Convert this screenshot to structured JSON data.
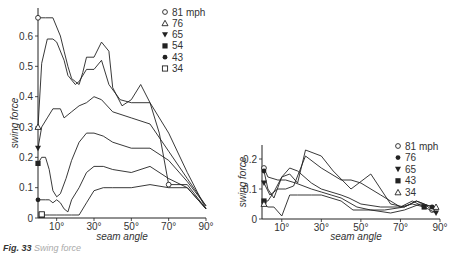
{
  "caption": {
    "label": "Fig. 33",
    "text": "Swing force"
  },
  "chart_data": [
    {
      "type": "line",
      "title": "",
      "xlabel": "seam angle",
      "ylabel": "swing force",
      "xlim": [
        0,
        90
      ],
      "ylim": [
        0,
        0.68
      ],
      "xticks": [
        "10°",
        "30°",
        "50°",
        "70°",
        "90°"
      ],
      "yticks": [
        "0",
        "0.1",
        "0.2",
        "0.3",
        "0.4",
        "0.5",
        "0.6"
      ],
      "grid": false,
      "legend_position": "upper right",
      "series": [
        {
          "name": "81 mph",
          "marker": "circle-open",
          "x": [
            0,
            4,
            8,
            12,
            14,
            16,
            18,
            20,
            22,
            24,
            26,
            30,
            34,
            38,
            40,
            45,
            50,
            55,
            60,
            65,
            70,
            80,
            90
          ],
          "y": [
            0.66,
            0.66,
            0.66,
            0.6,
            0.55,
            0.5,
            0.46,
            0.45,
            0.44,
            0.48,
            0.53,
            0.53,
            0.58,
            0.55,
            0.43,
            0.37,
            0.39,
            0.44,
            0.38,
            0.28,
            0.11,
            0.11,
            0.03
          ]
        },
        {
          "name": "76",
          "marker": "triangle-open",
          "x": [
            0,
            2,
            5,
            8,
            10,
            14,
            16,
            20,
            22,
            26,
            30,
            34,
            38,
            44,
            50,
            60,
            70,
            80,
            90
          ],
          "y": [
            0.3,
            0.51,
            0.59,
            0.59,
            0.58,
            0.52,
            0.47,
            0.44,
            0.45,
            0.49,
            0.49,
            0.52,
            0.44,
            0.39,
            0.38,
            0.38,
            0.28,
            0.15,
            0.03
          ]
        },
        {
          "name": "65",
          "marker": "triangle-down-filled",
          "x": [
            0,
            2,
            5,
            8,
            12,
            14,
            18,
            22,
            26,
            30,
            34,
            40,
            50,
            60,
            70,
            80,
            90
          ],
          "y": [
            0.23,
            0.3,
            0.33,
            0.36,
            0.36,
            0.33,
            0.35,
            0.37,
            0.38,
            0.4,
            0.39,
            0.35,
            0.33,
            0.31,
            0.22,
            0.13,
            0.04
          ]
        },
        {
          "name": "54",
          "marker": "square-filled",
          "x": [
            0,
            2,
            4,
            6,
            8,
            10,
            12,
            15,
            18,
            22,
            26,
            30,
            35,
            40,
            50,
            60,
            70,
            80,
            90
          ],
          "y": [
            0.18,
            0.2,
            0.2,
            0.16,
            0.09,
            0.07,
            0.08,
            0.13,
            0.19,
            0.25,
            0.28,
            0.28,
            0.27,
            0.25,
            0.23,
            0.23,
            0.19,
            0.12,
            0.04
          ]
        },
        {
          "name": "43",
          "marker": "circle-filled",
          "x": [
            0,
            4,
            6,
            8,
            10,
            12,
            14,
            16,
            18,
            22,
            26,
            30,
            35,
            40,
            50,
            60,
            70,
            80,
            90
          ],
          "y": [
            0.06,
            0.06,
            0.06,
            0.05,
            0.06,
            0.05,
            0.03,
            0.02,
            0.06,
            0.1,
            0.15,
            0.17,
            0.17,
            0.16,
            0.15,
            0.17,
            0.13,
            0.1,
            0.03
          ]
        },
        {
          "name": "34",
          "marker": "square-open",
          "x": [
            2,
            6,
            10,
            14,
            18,
            22,
            26,
            30,
            35,
            40,
            50,
            60,
            70,
            80,
            90
          ],
          "y": [
            0.01,
            0.01,
            0.01,
            0.01,
            0.01,
            0.01,
            0.05,
            0.09,
            0.1,
            0.1,
            0.1,
            0.11,
            0.1,
            0.1,
            0.03
          ]
        }
      ]
    },
    {
      "type": "line",
      "title": "",
      "xlabel": "seam angle",
      "ylabel": "swing force",
      "xlim": [
        0,
        90
      ],
      "ylim": [
        0,
        0.26
      ],
      "xticks": [
        "10°",
        "30°",
        "50°",
        "70°",
        "90°"
      ],
      "yticks": [
        "0",
        "0.1",
        "0.2"
      ],
      "grid": false,
      "legend_position": "upper right",
      "series": [
        {
          "name": "81 mph",
          "marker": "circle-open",
          "x": [
            1,
            3,
            8,
            12,
            17,
            25,
            30,
            35,
            40,
            48,
            55,
            62,
            72,
            78,
            82,
            86
          ],
          "y": [
            0.17,
            0.14,
            0.13,
            0.13,
            0.12,
            0.1,
            0.09,
            0.08,
            0.07,
            0.04,
            0.03,
            0.03,
            0.04,
            0.06,
            0.05,
            0.03
          ]
        },
        {
          "name": "76",
          "marker": "circle-filled",
          "x": [
            1,
            3,
            6,
            10,
            14,
            18,
            22,
            30,
            36,
            45,
            55,
            60,
            65,
            72,
            78,
            82,
            86
          ],
          "y": [
            0.16,
            0.1,
            0.07,
            0.14,
            0.15,
            0.12,
            0.23,
            0.21,
            0.16,
            0.1,
            0.15,
            0.1,
            0.05,
            0.04,
            0.06,
            0.05,
            0.04
          ]
        },
        {
          "name": "65",
          "marker": "triangle-down-filled",
          "x": [
            1,
            4,
            8,
            12,
            16,
            22,
            30,
            40,
            45,
            50,
            60,
            70,
            76,
            82,
            88
          ],
          "y": [
            0.12,
            0.08,
            0.1,
            0.1,
            0.11,
            0.21,
            0.17,
            0.13,
            0.13,
            0.12,
            0.08,
            0.04,
            0.06,
            0.04,
            0.02
          ]
        },
        {
          "name": "43",
          "marker": "square-filled",
          "x": [
            1,
            3,
            6,
            10,
            14,
            18,
            25,
            30,
            40,
            44,
            50,
            60,
            70,
            76,
            82
          ],
          "y": [
            0.06,
            0.06,
            0.09,
            0.14,
            0.17,
            0.16,
            0.12,
            0.1,
            0.08,
            0.07,
            0.05,
            0.04,
            0.04,
            0.05,
            0.04
          ]
        },
        {
          "name": "34",
          "marker": "triangle-open",
          "x": [
            1,
            3,
            6,
            10,
            14,
            18,
            25,
            30,
            40,
            46,
            55,
            65,
            72,
            80,
            88
          ],
          "y": [
            0.05,
            0.04,
            0.04,
            0.01,
            0.08,
            0.08,
            0.08,
            0.08,
            0.06,
            0.03,
            0.03,
            0.02,
            0.03,
            0.05,
            0.04
          ]
        }
      ]
    }
  ]
}
